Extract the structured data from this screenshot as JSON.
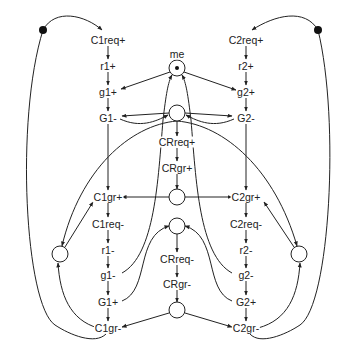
{
  "diagram": {
    "type": "petri-net / signal transition graph",
    "transitions": {
      "c1req_plus": "C1req+",
      "r1_plus": "r1+",
      "g1_plus": "g1+",
      "G1_minus": "G1-",
      "c1gr_plus": "C1gr+",
      "c1req_minus": "C1req-",
      "r1_minus": "r1-",
      "g1_minus": "g1-",
      "G1_plus": "G1+",
      "c1gr_minus": "C1gr-",
      "c2req_plus": "C2req+",
      "r2_plus": "r2+",
      "g2_plus": "g2+",
      "G2_minus": "G2-",
      "c2gr_plus": "C2gr+",
      "c2req_minus": "C2req-",
      "r2_minus": "r2-",
      "g2_minus": "g2-",
      "G2_plus": "G2+",
      "c2gr_minus": "C2gr-",
      "crreq_plus": "CRreq+",
      "crgr_plus": "CRgr+",
      "crreq_minus": "CRreq-",
      "crgr_minus": "CRgr-"
    },
    "places": {
      "me_label": "me",
      "me_tokens": 1,
      "top_left_loop_tokens": 1,
      "top_right_loop_tokens": 1
    },
    "colors": {
      "stroke": "#222222",
      "background": "#ffffff"
    }
  }
}
